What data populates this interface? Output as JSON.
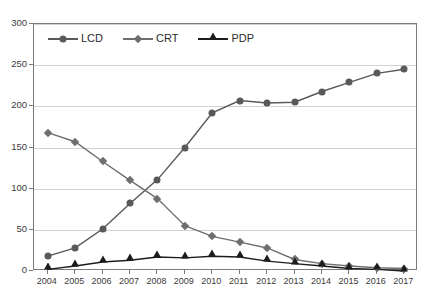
{
  "chart_data": {
    "type": "line",
    "title": "",
    "xlabel": "",
    "ylabel": "",
    "ylim": [
      0,
      300
    ],
    "ytick_step": 50,
    "yticks": [
      0,
      50,
      100,
      150,
      200,
      250,
      300
    ],
    "grid": true,
    "legend_position": "top-left-inside",
    "categories": [
      "2004",
      "2005",
      "2006",
      "2007",
      "2008",
      "2009",
      "2010",
      "2011",
      "2012",
      "2013",
      "2014",
      "2015",
      "2016",
      "2017"
    ],
    "series": [
      {
        "name": "LCD",
        "marker": "circle",
        "color": "#595959",
        "values": [
          18,
          28,
          51,
          82,
          111,
          150,
          192,
          207,
          204,
          205,
          218,
          229,
          240,
          245
        ]
      },
      {
        "name": "CRT",
        "marker": "diamond",
        "color": "#6e6e6e",
        "values": [
          168,
          157,
          133,
          110,
          88,
          55,
          42,
          35,
          28,
          14,
          9,
          6,
          4,
          3
        ]
      },
      {
        "name": "PDP",
        "marker": "triangle",
        "color": "#1c1c1c",
        "values": [
          2,
          6,
          11,
          13,
          17,
          16,
          18,
          17,
          12,
          9,
          6,
          3,
          2,
          0
        ]
      }
    ]
  },
  "axis": {
    "y_tick_labels": [
      "300",
      "250",
      "200",
      "150",
      "100",
      "50",
      "0"
    ],
    "x_tick_labels": [
      "2004",
      "2005",
      "2006",
      "2007",
      "2008",
      "2009",
      "2010",
      "2011",
      "2012",
      "2013",
      "2014",
      "2015",
      "2016",
      "2017"
    ]
  },
  "legend": {
    "items": [
      {
        "label": "LCD",
        "marker": "circle-marker",
        "color": "#595959"
      },
      {
        "label": "CRT",
        "marker": "diamond-marker",
        "color": "#6e6e6e"
      },
      {
        "label": "PDP",
        "marker": "triangle-marker",
        "color": "#1c1c1c"
      }
    ]
  },
  "colors": {
    "frame": "#7a7a7a",
    "gridline": "#d2d2d2",
    "background": "#ffffff",
    "tick_text": "#3b3b3b"
  }
}
